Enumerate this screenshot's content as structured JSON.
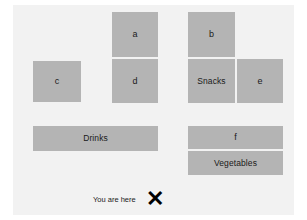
{
  "map": {
    "background_color": "#f2f2f2",
    "block_color": "#b4b4b4",
    "gap_color": "#f2f2f2",
    "text_color": "#1a1a1a",
    "marker_color": "#000000",
    "blocks": [
      {
        "id": "a",
        "label": "a",
        "x": 99,
        "y": 7,
        "w": 46,
        "h": 45
      },
      {
        "id": "b",
        "label": "b",
        "x": 175,
        "y": 7,
        "w": 47,
        "h": 45
      },
      {
        "id": "c",
        "label": "c",
        "x": 20,
        "y": 56,
        "w": 48,
        "h": 41
      },
      {
        "id": "d",
        "label": "d",
        "x": 99,
        "y": 54,
        "w": 46,
        "h": 44
      },
      {
        "id": "snacks",
        "label": "Snacks",
        "x": 175,
        "y": 54,
        "w": 47,
        "h": 44
      },
      {
        "id": "e",
        "label": "e",
        "x": 224,
        "y": 54,
        "w": 46,
        "h": 44
      },
      {
        "id": "drinks",
        "label": "Drinks",
        "x": 20,
        "y": 121,
        "w": 125,
        "h": 25
      },
      {
        "id": "f",
        "label": "f",
        "x": 175,
        "y": 121,
        "w": 95,
        "h": 23
      },
      {
        "id": "vegetables",
        "label": "Vegetables",
        "x": 175,
        "y": 146,
        "w": 95,
        "h": 24
      }
    ],
    "you_are_here": {
      "label": "You are here",
      "label_x": 80,
      "label_y": 190,
      "marker": "✕",
      "marker_x": 133,
      "marker_y": 183
    }
  }
}
